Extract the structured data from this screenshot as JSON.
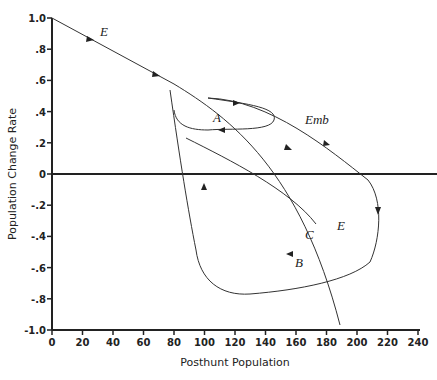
{
  "chart_data": {
    "type": "line",
    "title": "",
    "xlabel": "Posthunt Population",
    "ylabel": "Population Change Rate",
    "xlim": [
      0,
      240
    ],
    "ylim": [
      -1.0,
      1.0
    ],
    "x_ticks": [
      "0",
      "20",
      "40",
      "60",
      "80",
      "100",
      "120",
      "140",
      "160",
      "180",
      "200",
      "220",
      "240"
    ],
    "y_ticks": [
      "1.0",
      ".8",
      ".6",
      ".4",
      ".2",
      "0",
      "-.2",
      "-.4",
      "-.6",
      "-.8",
      "-1.0"
    ],
    "grid": false,
    "series": [
      {
        "name": "E",
        "description": "equilibrium line descending from (0,1.0) to ~(80,0.58), continuing to end near (195,-0.40)",
        "points": [
          [
            0,
            1.0
          ],
          [
            40,
            0.79
          ],
          [
            80,
            0.58
          ],
          [
            120,
            0.37
          ],
          [
            160,
            0.1
          ],
          [
            180,
            0.0
          ],
          [
            195,
            -0.4
          ]
        ]
      },
      {
        "name": "A",
        "description": "small loop",
        "points": [
          [
            85,
            0.55
          ],
          [
            110,
            0.46
          ],
          [
            150,
            0.4
          ],
          [
            145,
            0.28
          ],
          [
            110,
            0.26
          ],
          [
            90,
            0.35
          ]
        ]
      },
      {
        "name": "Emb",
        "points": [
          [
            110,
            0.47
          ],
          [
            150,
            0.43
          ],
          [
            190,
            0.25
          ],
          [
            215,
            0.0
          ],
          [
            220,
            -0.35
          ],
          [
            200,
            -0.48
          ],
          [
            150,
            -0.5
          ]
        ]
      },
      {
        "name": "B",
        "points": [
          [
            150,
            -0.5
          ],
          [
            120,
            -0.48
          ],
          [
            100,
            -0.2
          ],
          [
            90,
            0.2
          ],
          [
            80,
            0.58
          ]
        ]
      },
      {
        "name": "C",
        "points": [
          [
            88,
            0.22
          ],
          [
            130,
            0.05
          ],
          [
            160,
            -0.15
          ],
          [
            176,
            -0.36
          ]
        ]
      }
    ],
    "annotations": [
      "E",
      "A",
      "Emb",
      "B",
      "C",
      "E"
    ]
  },
  "labels": {
    "E_top": "E",
    "A": "A",
    "Emb": "Emb",
    "B": "B",
    "C": "C",
    "E_bottom": "E"
  }
}
